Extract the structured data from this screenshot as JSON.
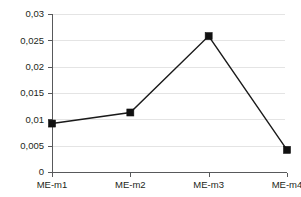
{
  "chart_data": {
    "type": "line",
    "title": "",
    "subtitle": "",
    "xlabel": "",
    "ylabel": "",
    "categories": [
      "ME-m1",
      "ME-m2",
      "ME-m3",
      "ME-m4"
    ],
    "values": [
      0.0092,
      0.0113,
      0.0258,
      0.0042
    ],
    "series": [
      {
        "name": "",
        "values": [
          0.0092,
          0.0113,
          0.0258,
          0.0042
        ]
      }
    ],
    "ylim": [
      0,
      0.03
    ],
    "ytick_values": [
      0,
      0.005,
      0.01,
      0.015,
      0.02,
      0.025,
      0.03
    ],
    "ytick_labels": [
      "0",
      "0,005",
      "0,01",
      "0,015",
      "0,02",
      "0,025",
      "0,03"
    ],
    "xtick_labels": [
      "ME-m1",
      "ME-m2",
      "ME-m3",
      "ME-m4"
    ],
    "decimal_separator": ",",
    "grid": true,
    "grid_axis": "y",
    "legend": false,
    "legend_position": "none",
    "marker": "square",
    "colors": {
      "line": "#1a1a1a",
      "marker": "#111111",
      "gridline": "#e4e4e4",
      "axis": "#58595b",
      "text": "#231f20",
      "background": "#ffffff"
    }
  }
}
